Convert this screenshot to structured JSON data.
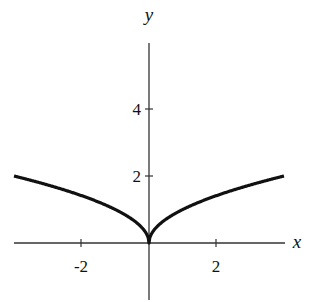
{
  "chart_data": {
    "type": "line",
    "title": "",
    "xlabel": "x",
    "ylabel": "y",
    "x_ticks": [
      -2,
      2
    ],
    "y_ticks": [
      2,
      4
    ],
    "xlim": [
      -4,
      4
    ],
    "ylim": [
      -1.7,
      6
    ],
    "grid": false,
    "legend": null,
    "series": [
      {
        "name": "y = sqrt(|x|)",
        "x": [
          -4,
          -3,
          -2,
          -1,
          -0.5,
          -0.1,
          0,
          0.1,
          0.5,
          1,
          2,
          3,
          4
        ],
        "y": [
          2,
          1.73,
          1.41,
          1,
          0.71,
          0.32,
          0,
          0.32,
          0.71,
          1,
          1.41,
          1.73,
          2
        ]
      }
    ]
  },
  "labels": {
    "x_axis": "x",
    "y_axis": "y",
    "tick_x_neg2": "-2",
    "tick_x_2": "2",
    "tick_y_2": "2",
    "tick_y_4": "4"
  }
}
